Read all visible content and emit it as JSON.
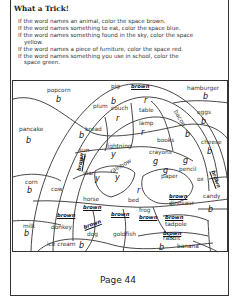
{
  "title": "What a Trick!",
  "instructions": [
    {
      "text": "If the word names an animal, color the space brown.",
      "indent": false
    },
    {
      "text": "If the word names something to eat, color the space blue.",
      "indent": false
    },
    {
      "text": "If the word names something found in the sky, color the space",
      "indent": false
    },
    {
      "text": "yellow.",
      "indent": true
    },
    {
      "text": "If the word names a piece of furniture, color the space red.",
      "indent": false
    },
    {
      "text": "If the word names something you use in school, color the",
      "indent": false
    },
    {
      "text": "space green.",
      "indent": true
    }
  ],
  "regions": {
    "popcorn": {
      "word": "popcorn",
      "mark": "b"
    },
    "pig": {
      "word": "pig",
      "mark": "brown"
    },
    "hamburger": {
      "word": "hamburger",
      "mark": "b"
    },
    "plum": {
      "word": "plum",
      "mark": "b"
    },
    "couch": {
      "word": "couch",
      "mark": "r"
    },
    "table": {
      "word": "table",
      "mark": "r"
    },
    "eggs": {
      "word": "eggs",
      "mark": "b"
    },
    "pancake": {
      "word": "pancake",
      "mark": "b"
    },
    "bread": {
      "word": "bread",
      "mark": "b"
    },
    "lamp": {
      "word": "lamp",
      "mark": "r"
    },
    "bacon": {
      "word": "bacon",
      "mark": "b"
    },
    "books": {
      "word": "books",
      "mark": "g"
    },
    "cheese": {
      "word": "cheese",
      "mark": "b"
    },
    "sun": {
      "word": "sun",
      "mark": "y"
    },
    "lightning": {
      "word": "lightning",
      "mark": "y"
    },
    "crayons": {
      "word": "crayons",
      "mark": "g"
    },
    "star": {
      "word": "star",
      "mark": "y"
    },
    "rainbow": {
      "word": "rainbow",
      "mark": "y"
    },
    "pencil": {
      "word": "pencil",
      "mark": "g"
    },
    "paper": {
      "word": "paper",
      "mark": "g"
    },
    "ox": {
      "word": "ox",
      "mark": "brown"
    },
    "corn": {
      "word": "corn",
      "mark": "b"
    },
    "cow": {
      "word": "cow",
      "mark": "brown"
    },
    "bed": {
      "word": "bed",
      "mark": "r"
    },
    "horse": {
      "word": "horse",
      "mark": "brown"
    },
    "frog": {
      "word": "frog",
      "mark": "brown"
    },
    "dinosaur": {
      "word": "dinosaur",
      "mark": "brown"
    },
    "candy": {
      "word": "candy",
      "mark": "b"
    },
    "tadpole": {
      "word": "tadpole",
      "mark": "brown"
    },
    "milk": {
      "word": "milk",
      "mark": "b"
    },
    "donkey": {
      "word": "donkey",
      "mark": "brown"
    },
    "dog": {
      "word": "dog",
      "mark": "brown"
    },
    "goldfish": {
      "word": "goldfish",
      "mark": "brown"
    },
    "rabbit": {
      "word": "rabbit",
      "mark": "brown"
    },
    "ice_cream": {
      "word": "ice cream",
      "mark": "b"
    },
    "banana": {
      "word": "banana",
      "mark": "b"
    },
    "extra_brown": {
      "mark": "brown"
    }
  },
  "footer": "Page 44"
}
